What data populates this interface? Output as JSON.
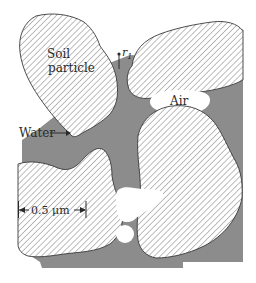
{
  "diagram": {
    "type": "soil-pore-cross-section",
    "colors": {
      "water": "#8c8c8c",
      "particle_fill": "#ffffff",
      "hatch": "#6e6e6e",
      "outline": "#3a3a3a",
      "air": "#ffffff",
      "text": "#2a2a2a"
    },
    "labels": {
      "soil_particle_line1": "Soil",
      "soil_particle_line2": "particle",
      "radius": "r",
      "radius_subscript": "1",
      "air": "Air",
      "water": "Water",
      "scale": "0.5 μm"
    },
    "regions": [
      {
        "name": "soil-particle",
        "count": 4
      },
      {
        "name": "water",
        "description": "gray pore water filling gaps between particles"
      },
      {
        "name": "air",
        "description": "air pockets within pores"
      }
    ]
  }
}
